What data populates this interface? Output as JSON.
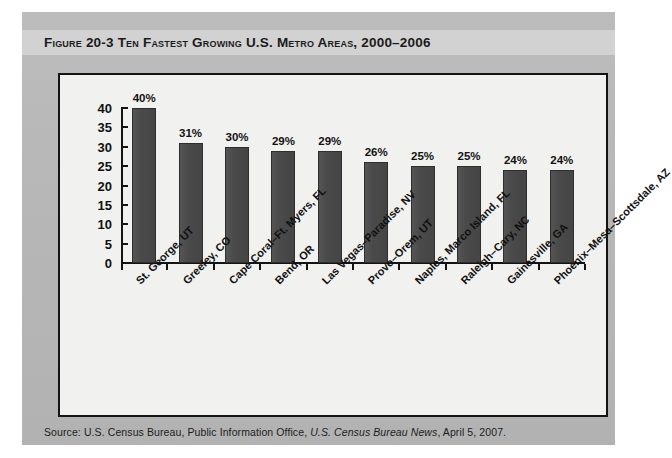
{
  "figure": {
    "label": "Figure 20-3",
    "title": "Ten Fastest Growing U.S. Metro Areas, 2000–2006",
    "full_title": "Figure 20-3   Ten Fastest Growing U.S. Metro Areas, 2000–2006"
  },
  "source": {
    "prefix": "Source: U.S. Census Bureau, Public Information Office, ",
    "italic": "U.S. Census Bureau News",
    "suffix": ", April 5, 2007.",
    "full": "Source: U.S. Census Bureau, Public Information Office, U.S. Census Bureau News, April 5, 2007."
  },
  "colors": {
    "page_background": "#b9b9b9",
    "title_band": "#d2d2d2",
    "panel_background": "#f1f1ef",
    "panel_border": "#141414",
    "bar_fill": "#4a4a4a",
    "axis": "#141414",
    "text": "#111111"
  },
  "chart_data": {
    "type": "bar",
    "title": "Ten Fastest Growing U.S. Metro Areas, 2000–2006",
    "xlabel": "",
    "ylabel": "",
    "ylim": [
      0,
      40
    ],
    "yticks": [
      0,
      5,
      10,
      15,
      20,
      25,
      30,
      35,
      40
    ],
    "ytick_labels": [
      "0",
      "5",
      "10",
      "15",
      "20",
      "25",
      "30",
      "35",
      "40"
    ],
    "grid": false,
    "legend": false,
    "value_label_suffix": "%",
    "categories": [
      "St. George, UT",
      "Greeley, CO",
      "Cape Coral–Ft. Myers, FL",
      "Bend, OR",
      "Las Vegas–Paradise, NV",
      "Provo–Orem, UT",
      "Naples, Marco Island, FL",
      "Raleigh–Cary, NC",
      "Gainesville, GA",
      "Phoenix–Mesa–Scottsdale, AZ"
    ],
    "values": [
      40,
      31,
      30,
      29,
      29,
      26,
      25,
      25,
      24,
      24
    ],
    "value_labels": [
      "40%",
      "31%",
      "30%",
      "29%",
      "29%",
      "26%",
      "25%",
      "25%",
      "24%",
      "24%"
    ]
  }
}
